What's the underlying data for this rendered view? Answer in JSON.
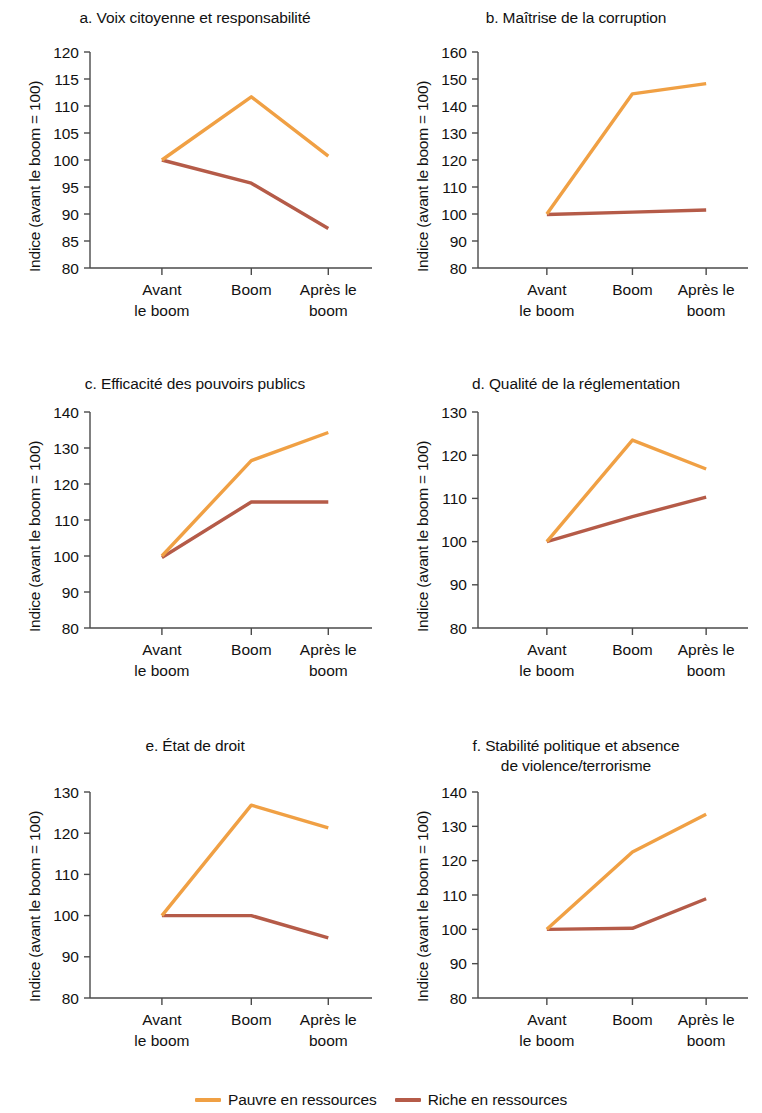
{
  "legend": {
    "items": [
      {
        "label": "Pauvre en ressources",
        "color": "#F0A044"
      },
      {
        "label": "Riche en ressources",
        "color": "#B55B48"
      }
    ]
  },
  "colors": {
    "resource_poor": "#F0A044",
    "resource_rich": "#B55B48",
    "axis": "#4a4a4a",
    "text": "#111111"
  },
  "chart_data": [
    {
      "id": "a",
      "type": "line",
      "title": "a. Voix citoyenne et responsabilité",
      "ylabel": "Indice (avant le boom = 100)",
      "xlabel": "",
      "categories": [
        "Avant le boom",
        "Boom",
        "Après le boom"
      ],
      "xtick_lines": [
        [
          "Avant",
          "le boom"
        ],
        [
          "Boom",
          ""
        ],
        [
          "Après le",
          "boom"
        ]
      ],
      "ylim": [
        80,
        120
      ],
      "yticks": [
        80,
        85,
        90,
        95,
        100,
        105,
        110,
        115,
        120
      ],
      "grid": false,
      "legend_position": "bottom-figure",
      "series": [
        {
          "name": "Pauvre en ressources",
          "values": [
            100,
            111.7,
            100.7
          ]
        },
        {
          "name": "Riche en ressources",
          "values": [
            100,
            95.7,
            87.3
          ]
        }
      ]
    },
    {
      "id": "b",
      "type": "line",
      "title": "b. Maîtrise de la corruption",
      "ylabel": "Indice (avant le boom = 100)",
      "xlabel": "",
      "categories": [
        "Avant le boom",
        "Boom",
        "Après le boom"
      ],
      "xtick_lines": [
        [
          "Avant",
          "le boom"
        ],
        [
          "Boom",
          ""
        ],
        [
          "Après le",
          "boom"
        ]
      ],
      "ylim": [
        80,
        160
      ],
      "yticks": [
        80,
        90,
        100,
        110,
        120,
        130,
        140,
        150,
        160
      ],
      "grid": false,
      "legend_position": "bottom-figure",
      "series": [
        {
          "name": "Pauvre en ressources",
          "values": [
            100,
            144.5,
            148.3
          ]
        },
        {
          "name": "Riche en ressources",
          "values": [
            99.8,
            100.7,
            101.5
          ]
        }
      ]
    },
    {
      "id": "c",
      "type": "line",
      "title": "c. Efficacité des pouvoirs publics",
      "ylabel": "Indice (avant le boom = 100)",
      "xlabel": "",
      "categories": [
        "Avant le boom",
        "Boom",
        "Après le boom"
      ],
      "xtick_lines": [
        [
          "Avant",
          "le boom"
        ],
        [
          "Boom",
          ""
        ],
        [
          "Après le",
          "boom"
        ]
      ],
      "ylim": [
        80,
        140
      ],
      "yticks": [
        80,
        90,
        100,
        110,
        120,
        130,
        140
      ],
      "grid": false,
      "legend_position": "bottom-figure",
      "series": [
        {
          "name": "Pauvre en ressources",
          "values": [
            100,
            126.5,
            134.3
          ]
        },
        {
          "name": "Riche en ressources",
          "values": [
            99.6,
            115.0,
            115.0
          ]
        }
      ]
    },
    {
      "id": "d",
      "type": "line",
      "title": "d. Qualité de la réglementation",
      "ylabel": "Indice (avant le boom = 100)",
      "xlabel": "",
      "categories": [
        "Avant le boom",
        "Boom",
        "Après le boom"
      ],
      "xtick_lines": [
        [
          "Avant",
          "le boom"
        ],
        [
          "Boom",
          ""
        ],
        [
          "Après le",
          "boom"
        ]
      ],
      "ylim": [
        80,
        130
      ],
      "yticks": [
        80,
        90,
        100,
        110,
        120,
        130
      ],
      "grid": false,
      "legend_position": "bottom-figure",
      "series": [
        {
          "name": "Pauvre en ressources",
          "values": [
            100,
            123.5,
            116.8
          ]
        },
        {
          "name": "Riche en ressources",
          "values": [
            100,
            105.8,
            110.3
          ]
        }
      ]
    },
    {
      "id": "e",
      "type": "line",
      "title": "e. État de droit",
      "ylabel": "Indice (avant le boom = 100)",
      "xlabel": "",
      "categories": [
        "Avant le boom",
        "Boom",
        "Après le boom"
      ],
      "xtick_lines": [
        [
          "Avant",
          "le boom"
        ],
        [
          "Boom",
          ""
        ],
        [
          "Après le",
          "boom"
        ]
      ],
      "ylim": [
        80,
        130
      ],
      "yticks": [
        80,
        90,
        100,
        110,
        120,
        130
      ],
      "grid": false,
      "legend_position": "bottom-figure",
      "series": [
        {
          "name": "Pauvre en ressources",
          "values": [
            100,
            126.8,
            121.3
          ]
        },
        {
          "name": "Riche en ressources",
          "values": [
            100,
            100.0,
            94.6
          ]
        }
      ]
    },
    {
      "id": "f",
      "type": "line",
      "title": "f. Stabilité politique et absence de violence/terrorisme",
      "title_lines": [
        "f. Stabilité politique et absence",
        "de violence/terrorisme"
      ],
      "ylabel": "Indice (avant le boom = 100)",
      "xlabel": "",
      "categories": [
        "Avant le boom",
        "Boom",
        "Après le boom"
      ],
      "xtick_lines": [
        [
          "Avant",
          "le boom"
        ],
        [
          "Boom",
          ""
        ],
        [
          "Après le",
          "boom"
        ]
      ],
      "ylim": [
        80,
        140
      ],
      "yticks": [
        80,
        90,
        100,
        110,
        120,
        130,
        140
      ],
      "grid": false,
      "legend_position": "bottom-figure",
      "series": [
        {
          "name": "Pauvre en ressources",
          "values": [
            100,
            122.5,
            133.5
          ]
        },
        {
          "name": "Riche en ressources",
          "values": [
            100,
            100.3,
            108.9
          ]
        }
      ]
    }
  ]
}
